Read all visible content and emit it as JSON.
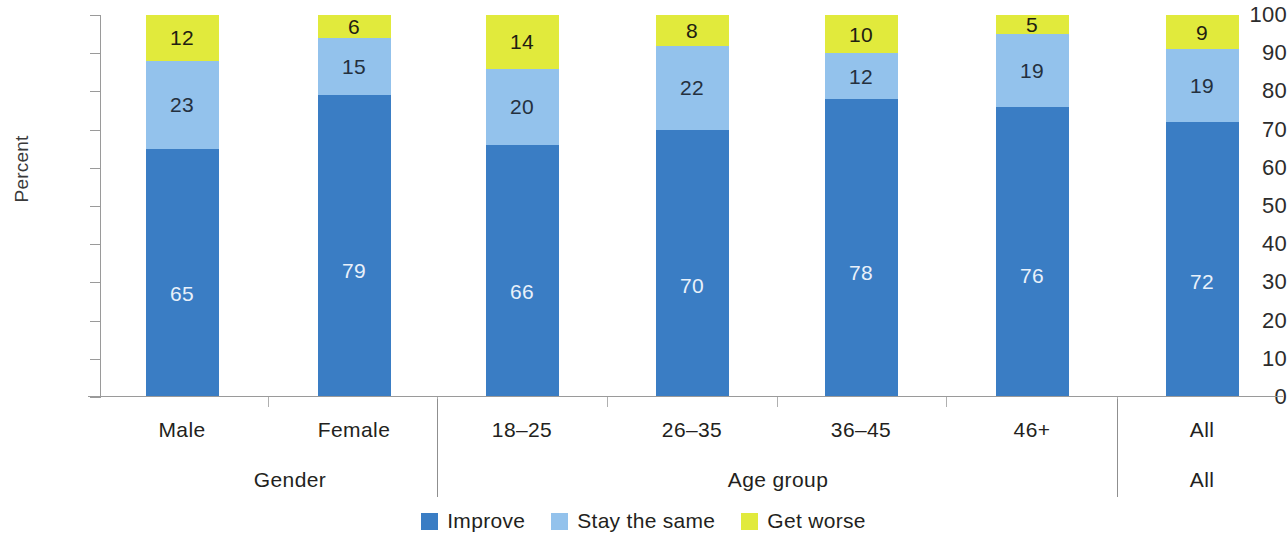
{
  "chart_data": {
    "type": "bar",
    "subtype": "stacked-bar-100",
    "title": "",
    "xlabel": "",
    "ylabel": "Percent",
    "ylim": [
      0,
      100
    ],
    "ytick_labels": [
      "0",
      "10",
      "20",
      "30",
      "40",
      "50",
      "60",
      "70",
      "80",
      "90",
      "100"
    ],
    "yticks": [
      0,
      10,
      20,
      30,
      40,
      50,
      60,
      70,
      80,
      90,
      100
    ],
    "grid": false,
    "legend_position": "bottom-center",
    "categories": [
      "Male",
      "Female",
      "18–25",
      "26–35",
      "36–45",
      "46+",
      "All"
    ],
    "groups": [
      {
        "label": "Gender",
        "categories": [
          "Male",
          "Female"
        ]
      },
      {
        "label": "Age group",
        "categories": [
          "18–25",
          "26–35",
          "36–45",
          "46+"
        ]
      },
      {
        "label": "All",
        "categories": [
          "All"
        ]
      }
    ],
    "series": [
      {
        "name": "Improve",
        "color": "#3a7dc4",
        "values": [
          65,
          79,
          66,
          70,
          78,
          76,
          72
        ]
      },
      {
        "name": "Stay the same",
        "color": "#93c2ec",
        "values": [
          23,
          15,
          20,
          22,
          12,
          19,
          19
        ]
      },
      {
        "name": "Get worse",
        "color": "#e1ea3c",
        "values": [
          12,
          6,
          14,
          8,
          10,
          5,
          9
        ]
      }
    ]
  },
  "axis": {
    "y_title": "Percent",
    "ticks": [
      {
        "label": "100",
        "value": 100
      },
      {
        "label": "90",
        "value": 90
      },
      {
        "label": "80",
        "value": 80
      },
      {
        "label": "70",
        "value": 70
      },
      {
        "label": "60",
        "value": 60
      },
      {
        "label": "50",
        "value": 50
      },
      {
        "label": "40",
        "value": 40
      },
      {
        "label": "30",
        "value": 30
      },
      {
        "label": "20",
        "value": 20
      },
      {
        "label": "10",
        "value": 10
      },
      {
        "label": "0",
        "value": 0
      }
    ]
  },
  "bars": [
    {
      "category": "Male",
      "improve": "65",
      "stay": "23",
      "worse": "12"
    },
    {
      "category": "Female",
      "improve": "79",
      "stay": "15",
      "worse": "6"
    },
    {
      "category": "18–25",
      "improve": "66",
      "stay": "20",
      "worse": "14"
    },
    {
      "category": "26–35",
      "improve": "70",
      "stay": "22",
      "worse": "8"
    },
    {
      "category": "36–45",
      "improve": "78",
      "stay": "12",
      "worse": "10"
    },
    {
      "category": "46+",
      "improve": "76",
      "stay": "19",
      "worse": "5"
    },
    {
      "category": "All",
      "improve": "72",
      "stay": "19",
      "worse": "9"
    }
  ],
  "category_labels": [
    {
      "text": "Male"
    },
    {
      "text": "Female"
    },
    {
      "text": "18–25"
    },
    {
      "text": "26–35"
    },
    {
      "text": "36–45"
    },
    {
      "text": "46+"
    },
    {
      "text": "All"
    }
  ],
  "group_labels": [
    {
      "text": "Gender"
    },
    {
      "text": "Age group"
    },
    {
      "text": "All"
    }
  ],
  "legend": {
    "items": [
      {
        "label": "Improve",
        "color": "#3a7dc4"
      },
      {
        "label": "Stay the same",
        "color": "#93c2ec"
      },
      {
        "label": "Get worse",
        "color": "#e1ea3c"
      }
    ]
  }
}
